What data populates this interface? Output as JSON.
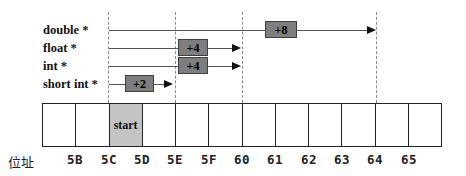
{
  "diagram": {
    "pointer_rows": [
      {
        "label": "double *",
        "offset": "+8"
      },
      {
        "label": "float *",
        "offset": "+4"
      },
      {
        "label": "int *",
        "offset": "+4"
      },
      {
        "label": "short int *",
        "offset": "+2"
      }
    ],
    "memory": {
      "start_cell_label": "start",
      "axis_label": "位址",
      "addresses": [
        "5B",
        "5C",
        "5D",
        "5E",
        "5F",
        "60",
        "61",
        "62",
        "63",
        "64",
        "65"
      ],
      "cell_count": 12
    },
    "colors": {
      "offset_box_fill": "#7e7e7e",
      "offset_box_border": "#3f3f3f",
      "start_cell_fill": "#c4c4c4",
      "arrow_line": "#555555",
      "arrowhead": "#111111",
      "dashed_guide": "#8a8a8a",
      "cell_border": "#222222",
      "background": "#ffffff"
    }
  }
}
